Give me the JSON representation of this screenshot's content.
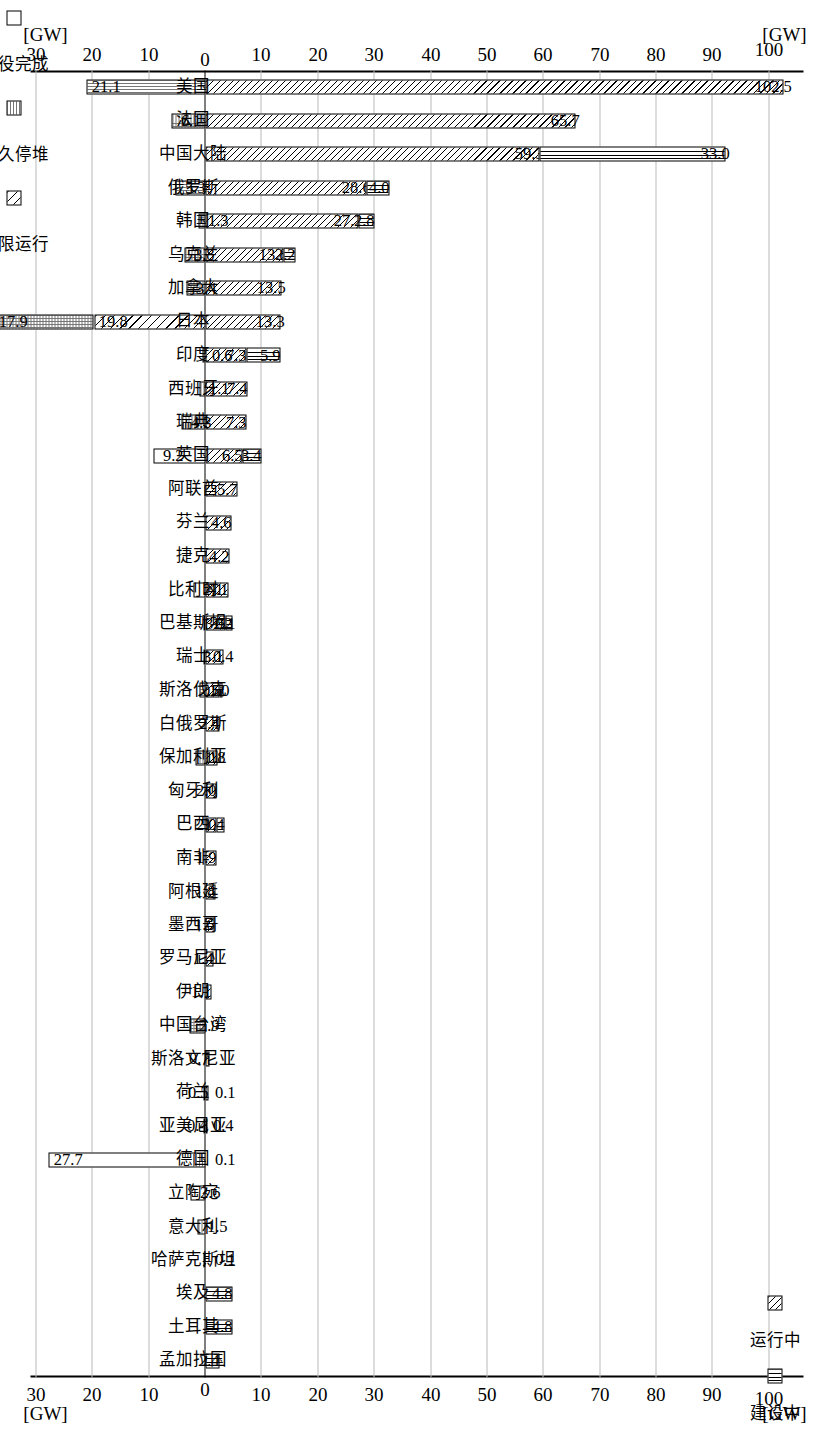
{
  "chart_data": {
    "type": "bar",
    "title": "",
    "xlabel": "",
    "ylabel": "[GW]",
    "unit": "[GW]",
    "ylim": [
      -30,
      105
    ],
    "grid": true,
    "orientation": "vertical-stacked-diverging",
    "axis_unit_label": "[GW]",
    "tick_labels_positive": [
      "0",
      "10",
      "20",
      "30",
      "40",
      "50",
      "60",
      "70",
      "80",
      "90",
      "100"
    ],
    "tick_labels_negative": [
      "10",
      "20",
      "30"
    ],
    "legend_top": {
      "position": "top-right",
      "entries": [
        {
          "label": "建设中",
          "pattern": "vertical-lines",
          "key": "construction"
        },
        {
          "label": "运行中",
          "pattern": "diagonal-hatch",
          "key": "operating"
        }
      ]
    },
    "legend_bottom": {
      "position": "bottom-left",
      "entries": [
        {
          "label": "受限运行",
          "pattern": "sparse-diagonal",
          "key": "limited"
        },
        {
          "label": "永久停堆",
          "pattern": "dotted-grid",
          "key": "shutdown"
        },
        {
          "label": "退役完成",
          "pattern": "white",
          "key": "decommissioned"
        }
      ]
    },
    "series": [
      {
        "name": "运行中",
        "key": "operating"
      },
      {
        "name": "建设中",
        "key": "construction"
      },
      {
        "name": "受限运行",
        "key": "limited"
      },
      {
        "name": "永久停堆",
        "key": "shutdown"
      },
      {
        "name": "退役完成",
        "key": "decommissioned"
      }
    ],
    "categories": [
      {
        "label": "美国",
        "operating": 102.5,
        "construction": 0,
        "limited": 0,
        "shutdown": 21.1,
        "decommissioned": 0
      },
      {
        "label": "法国",
        "operating": 65.7,
        "construction": 0,
        "limited": 0,
        "shutdown": 6.1,
        "decommissioned": 0
      },
      {
        "label": "中国大陆",
        "operating": 59.3,
        "construction": 33.0,
        "limited": 0,
        "shutdown": 0,
        "decommissioned": 0
      },
      {
        "label": "俄罗斯",
        "operating": 28.6,
        "construction": 4.0,
        "limited": 0,
        "shutdown": 5.3,
        "decommissioned": 0
      },
      {
        "label": "韩国",
        "operating": 27.1,
        "construction": 2.8,
        "limited": 0,
        "shutdown": 1.3,
        "decommissioned": 0
      },
      {
        "label": "乌克兰",
        "operating": 13.8,
        "construction": 2.2,
        "limited": 0,
        "shutdown": 3.8,
        "decommissioned": 0
      },
      {
        "label": "加拿大",
        "operating": 13.5,
        "construction": 0,
        "limited": 0,
        "shutdown": 3.4,
        "decommissioned": 0
      },
      {
        "label": "日本",
        "operating": 13.3,
        "construction": 0,
        "limited": 19.8,
        "shutdown": 17.9,
        "decommissioned": 0
      },
      {
        "label": "印度",
        "operating": 7.3,
        "construction": 5.9,
        "limited": 0,
        "shutdown": 0.6,
        "decommissioned": 0
      },
      {
        "label": "西班牙",
        "operating": 7.4,
        "construction": 0,
        "limited": 0,
        "shutdown": 1.1,
        "decommissioned": 0
      },
      {
        "label": "瑞典",
        "operating": 7.3,
        "construction": 0,
        "limited": 0,
        "shutdown": 4.3,
        "decommissioned": 0
      },
      {
        "label": "英国",
        "operating": 6.5,
        "construction": 3.4,
        "limited": 0,
        "shutdown": 9.2,
        "decommissioned": 0
      },
      {
        "label": "阿联酋",
        "operating": 5.7,
        "construction": 0,
        "limited": 0,
        "shutdown": 0,
        "decommissioned": 0
      },
      {
        "label": "芬兰",
        "operating": 4.6,
        "construction": 0,
        "limited": 0,
        "shutdown": 0,
        "decommissioned": 0
      },
      {
        "label": "捷克",
        "operating": 4.2,
        "construction": 0,
        "limited": 0,
        "shutdown": 0,
        "decommissioned": 0
      },
      {
        "label": "比利时",
        "operating": 4.1,
        "construction": 0,
        "limited": 0,
        "shutdown": 2.1,
        "decommissioned": 0
      },
      {
        "label": "巴基斯坦",
        "operating": 3.5,
        "construction": 1.2,
        "limited": 0,
        "shutdown": 0.1,
        "decommissioned": 0
      },
      {
        "label": "瑞士",
        "operating": 3.1,
        "construction": 0,
        "limited": 0,
        "shutdown": 0.4,
        "decommissioned": 0
      },
      {
        "label": "斯洛伐克",
        "operating": 2.5,
        "construction": 0.5,
        "limited": 0,
        "shutdown": 1.0,
        "decommissioned": 0
      },
      {
        "label": "白俄罗斯",
        "operating": 2.4,
        "construction": 0,
        "limited": 0,
        "shutdown": 0,
        "decommissioned": 0
      },
      {
        "label": "保加利亚",
        "operating": 2.1,
        "construction": 0,
        "limited": 0,
        "shutdown": 1.8,
        "decommissioned": 0
      },
      {
        "label": "匈牙利",
        "operating": 2.0,
        "construction": 0,
        "limited": 0,
        "shutdown": 0,
        "decommissioned": 0
      },
      {
        "label": "巴西",
        "operating": 2.0,
        "construction": 1.4,
        "limited": 0,
        "shutdown": 0,
        "decommissioned": 0
      },
      {
        "label": "南非",
        "operating": 1.9,
        "construction": 0,
        "limited": 0,
        "shutdown": 0,
        "decommissioned": 0
      },
      {
        "label": "阿根廷",
        "operating": 1.8,
        "construction": 0,
        "limited": 0,
        "shutdown": 0,
        "decommissioned": 0
      },
      {
        "label": "墨西哥",
        "operating": 1.6,
        "construction": 0,
        "limited": 0,
        "shutdown": 0,
        "decommissioned": 0
      },
      {
        "label": "罗马尼亚",
        "operating": 1.4,
        "construction": 0,
        "limited": 0,
        "shutdown": 0,
        "decommissioned": 0
      },
      {
        "label": "伊朗",
        "operating": 1.1,
        "construction": 0,
        "limited": 0,
        "shutdown": 0,
        "decommissioned": 0
      },
      {
        "label": "中国台湾",
        "operating": 0,
        "construction": 0,
        "limited": 0,
        "shutdown": 2.9,
        "decommissioned": 0
      },
      {
        "label": "斯洛文尼亚",
        "operating": 0.7,
        "construction": 0,
        "limited": 0,
        "shutdown": 0,
        "decommissioned": 0
      },
      {
        "label": "荷兰",
        "operating": 0.5,
        "construction": 0,
        "limited": 0,
        "shutdown": 0.1,
        "decommissioned": 0
      },
      {
        "label": "亚美尼亚",
        "operating": 0.4,
        "construction": 0,
        "limited": 0,
        "shutdown": 0.4,
        "decommissioned": 0
      },
      {
        "label": "德国",
        "operating": 0,
        "construction": 0,
        "limited": 0.1,
        "shutdown": 27.7,
        "decommissioned": 0
      },
      {
        "label": "立陶宛",
        "operating": 0,
        "construction": 0,
        "limited": 0,
        "shutdown": 2.6,
        "decommissioned": 0
      },
      {
        "label": "意大利",
        "operating": 0,
        "construction": 0,
        "limited": 0,
        "shutdown": 1.5,
        "decommissioned": 0
      },
      {
        "label": "哈萨克斯坦",
        "operating": 0,
        "construction": 0,
        "limited": 0,
        "shutdown": 0.1,
        "decommissioned": 0
      },
      {
        "label": "埃及",
        "operating": 0,
        "construction": 4.8,
        "limited": 0,
        "shutdown": 0,
        "decommissioned": 0
      },
      {
        "label": "土耳其",
        "operating": 0,
        "construction": 4.8,
        "limited": 0,
        "shutdown": 0,
        "decommissioned": 0
      },
      {
        "label": "孟加拉国",
        "operating": 0,
        "construction": 2.4,
        "limited": 0,
        "shutdown": 0,
        "decommissioned": 0
      }
    ]
  }
}
